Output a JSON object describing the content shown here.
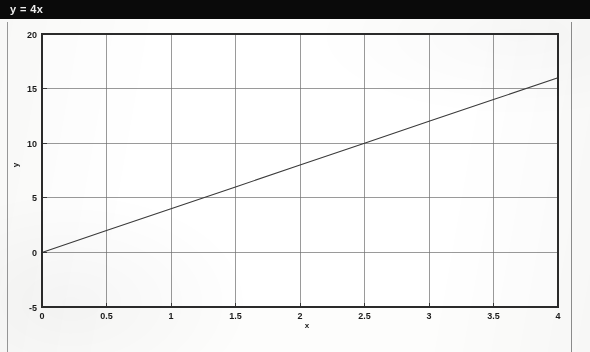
{
  "window": {
    "title": "y = 4x"
  },
  "chart_data": {
    "type": "line",
    "title": "y = 4x",
    "xlabel": "x",
    "ylabel": "y",
    "equation": "y = 4x",
    "slope": 4,
    "intercept": 0,
    "grid": true,
    "legend": "none",
    "xlim": [
      0,
      4
    ],
    "ylim": [
      -5,
      20
    ],
    "xticks": [
      0,
      0.5,
      1,
      1.5,
      2,
      2.5,
      3,
      3.5,
      4
    ],
    "xticklabels": [
      "0",
      "0.5",
      "1",
      "1.5",
      "2",
      "2.5",
      "3",
      "3.5",
      "4"
    ],
    "yticks": [
      -5,
      0,
      5,
      10,
      15,
      20
    ],
    "yticklabels": [
      "-5",
      "0",
      "5",
      "10",
      "15",
      "20"
    ],
    "series": [
      {
        "name": "y = 4x",
        "x": [
          0,
          0.5,
          1,
          1.5,
          2,
          2.5,
          3,
          3.5,
          4
        ],
        "values": [
          0,
          2,
          4,
          6,
          8,
          10,
          12,
          14,
          16
        ],
        "color": "#3a3a3a"
      }
    ]
  },
  "colors": {
    "titlebar_background": "#0a0a0a",
    "titlebar_text": "#f2f2f2",
    "page_background": "#fdfdfc",
    "axis": "#2b2b2b",
    "grid": "#6f6f6f",
    "line": "#3a3a3a"
  }
}
